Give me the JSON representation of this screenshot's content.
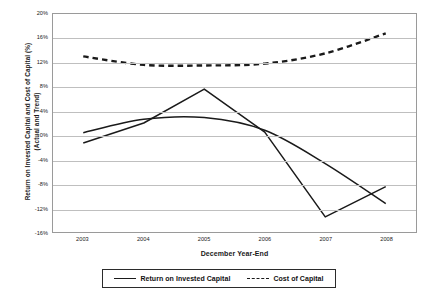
{
  "chart_data": {
    "type": "line",
    "title": "",
    "xlabel": "December Year-End",
    "ylabel_lines": [
      "Return on Invested Capital  and Cost of Capital (%)",
      "(Actual and Trend)"
    ],
    "ylabel": "Return on Invested Capital and Cost of Capital (%) (Actual and Trend)",
    "categories": [
      "2003",
      "2004",
      "2005",
      "2006",
      "2007",
      "2008"
    ],
    "x": [
      2003,
      2004,
      2005,
      2006,
      2007,
      2008
    ],
    "ylim": [
      -16,
      20
    ],
    "ytick_labels": [
      "20%",
      "16%",
      "12%",
      "8%",
      "4%",
      "0%",
      "-4%",
      "-8%",
      "-12%",
      "-16%"
    ],
    "ytick_values": [
      20,
      16,
      12,
      8,
      4,
      0,
      -4,
      -8,
      -12,
      -16
    ],
    "grid": "horizontal",
    "legend_position": "bottom",
    "series": [
      {
        "name": "Return on Invested Capital",
        "style": "solid",
        "color": "#1a1a1a",
        "values": [
          -1.3,
          2.0,
          7.6,
          0.5,
          -13.5,
          -8.5
        ]
      },
      {
        "name": "Return on Invested Capital (Trend)",
        "style": "solid",
        "color": "#1a1a1a",
        "smooth": true,
        "values": [
          0.4,
          2.6,
          2.9,
          0.8,
          -4.7,
          -11.3
        ]
      },
      {
        "name": "Cost of Capital",
        "style": "dashed",
        "color": "#1a1a1a",
        "smooth": true,
        "values": [
          13.0,
          11.6,
          11.5,
          11.8,
          13.5,
          16.8
        ]
      }
    ]
  },
  "legend": {
    "items": [
      {
        "label": "Return on Invested Capital",
        "style": "solid"
      },
      {
        "label": "Cost of Capital",
        "style": "dashed"
      }
    ]
  },
  "colors": {
    "line": "#1a1a1a",
    "grid": "#bfbfbf",
    "border": "#9a9a9a",
    "background": "#ffffff"
  }
}
